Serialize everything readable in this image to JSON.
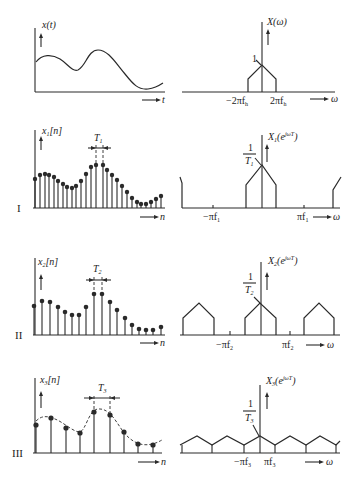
{
  "figure": {
    "top_left": {
      "ylabel": "x(t)",
      "xlabel": "t"
    },
    "top_right": {
      "ylabel": "X(ω)",
      "xlabel": "ω",
      "peak_label": "1",
      "ticks": [
        "−2πf_h",
        "2πf_h"
      ]
    },
    "rows": [
      {
        "roman": "I",
        "time_label": "x₁[n]",
        "period_label": "T₁",
        "xlabel": "n",
        "spec_label": "X₁(e^{jωT₁})",
        "peak_num": "1",
        "peak_den": "T₁",
        "ticks": [
          "−πf₁",
          "πf₁"
        ],
        "spec_xlabel": "ω"
      },
      {
        "roman": "II",
        "time_label": "x₂[n]",
        "period_label": "T₂",
        "xlabel": "n",
        "spec_label": "X₂(e^{jωT₂})",
        "peak_num": "1",
        "peak_den": "T₂",
        "ticks": [
          "−πf₂",
          "πf₂"
        ],
        "spec_xlabel": "ω"
      },
      {
        "roman": "III",
        "time_label": "x₃[n]",
        "period_label": "T₃",
        "xlabel": "n",
        "spec_label": "X₃(e^{jωT₃})",
        "peak_num": "1",
        "peak_den": "T₃",
        "ticks": [
          "−πf₃",
          "πf₃"
        ],
        "spec_xlabel": "ω"
      }
    ]
  },
  "text": {
    "xt": "x(t)",
    "t": "t",
    "Xw": "X(ω)",
    "w": "ω",
    "one": "1",
    "m2pifh": "−2πf",
    "p2pifh": "2πf",
    "h": "h",
    "I": "I",
    "II": "II",
    "III": "III",
    "x1": "x",
    "x2": "x",
    "x3": "x",
    "sub1": "1",
    "sub2": "2",
    "sub3": "3",
    "n_br": "[n]",
    "n": "n",
    "T": "T",
    "X": "X",
    "e_open": "(e",
    "jwT": "jωT",
    "close": ")",
    "mpif": "−πf",
    "pif": "πf"
  }
}
